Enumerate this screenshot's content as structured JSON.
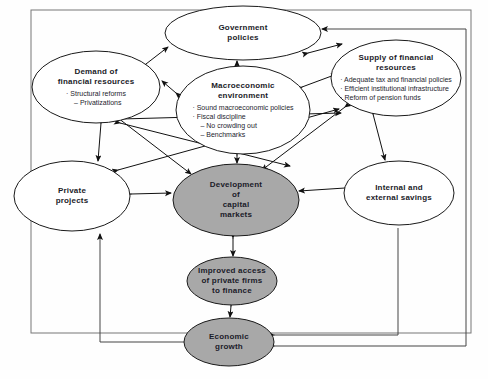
{
  "diagram": {
    "border_color": "#6a6a6a",
    "shaded_fill": "#a8a8a8",
    "plain_fill": "#ffffff",
    "stroke": "#1a1a1a",
    "nodes": [
      {
        "id": "government-policies",
        "title": "Government\npolicies",
        "title_lines": [
          "Government",
          "policies"
        ],
        "bullets": [],
        "shaded": false,
        "cx": 243,
        "cy": 33,
        "rx": 78,
        "ry": 27
      },
      {
        "id": "demand-of-financial-resources",
        "title_lines": [
          "Demand of",
          "financial resources"
        ],
        "bullets": [
          {
            "level": 1,
            "text": "· Structural reforms"
          },
          {
            "level": 2,
            "text": "– Privatizations"
          }
        ],
        "shaded": false,
        "cx": 96,
        "cy": 87,
        "rx": 64,
        "ry": 36
      },
      {
        "id": "macroeconomic-environment",
        "title_lines": [
          "Macroeconomic",
          "environment"
        ],
        "bullets": [
          {
            "level": 1,
            "text": "· Sound macroeconomic policies"
          },
          {
            "level": 1,
            "text": "· Fiscal discipline"
          },
          {
            "level": 2,
            "text": "– No crowding out"
          },
          {
            "level": 2,
            "text": "– Benchmarks"
          }
        ],
        "shaded": false,
        "cx": 243,
        "cy": 110,
        "rx": 67,
        "ry": 44
      },
      {
        "id": "supply-of-financial-resources",
        "title_lines": [
          "Supply of financial",
          "resources"
        ],
        "bullets": [
          {
            "level": 1,
            "text": "· Adequate tax and financial policies"
          },
          {
            "level": 1,
            "text": "· Efficient institutional infrastructure"
          },
          {
            "level": 1,
            "text": "· Reform of pension funds"
          }
        ],
        "shaded": false,
        "cx": 396,
        "cy": 78,
        "rx": 65,
        "ry": 38
      },
      {
        "id": "private-projects",
        "title_lines": [
          "Private",
          "projects"
        ],
        "bullets": [],
        "shaded": false,
        "cx": 72,
        "cy": 196,
        "rx": 58,
        "ry": 35
      },
      {
        "id": "development-of-capital-markets",
        "title_lines": [
          "Development",
          "of",
          "capital",
          "markets"
        ],
        "bullets": [],
        "shaded": true,
        "cx": 236,
        "cy": 200,
        "rx": 63,
        "ry": 36
      },
      {
        "id": "internal-and-external-savings",
        "title_lines": [
          "Internal and",
          "external savings"
        ],
        "bullets": [],
        "shaded": false,
        "cx": 399,
        "cy": 193,
        "rx": 55,
        "ry": 32
      },
      {
        "id": "improved-access-of-private-firms-to-finance",
        "title_lines": [
          "Improved access",
          "of private firms",
          "to finance"
        ],
        "bullets": [],
        "shaded": true,
        "cx": 232,
        "cy": 281,
        "rx": 45,
        "ry": 24
      },
      {
        "id": "economic-growth",
        "title_lines": [
          "Economic",
          "growth"
        ],
        "bullets": [],
        "shaded": true,
        "cx": 229,
        "cy": 342,
        "rx": 45,
        "ry": 24
      }
    ],
    "edges": [
      {
        "from": "demand-of-financial-resources",
        "to": "government-policies",
        "style": "bidirectional"
      },
      {
        "from": "macroeconomic-environment",
        "to": "government-policies",
        "style": "bidirectional"
      },
      {
        "from": "supply-of-financial-resources",
        "to": "government-policies",
        "style": "bidirectional"
      },
      {
        "from": "macroeconomic-environment",
        "to": "supply-of-financial-resources",
        "style": "bidirectional"
      },
      {
        "from": "macroeconomic-environment",
        "to": "demand-of-financial-resources",
        "style": "bidirectional"
      },
      {
        "from": "demand-of-financial-resources",
        "to": "private-projects",
        "style": "bidirectional"
      },
      {
        "from": "demand-of-financial-resources",
        "to": "development-of-capital-markets",
        "style": "bidirectional"
      },
      {
        "from": "supply-of-financial-resources",
        "to": "development-of-capital-markets",
        "style": "bidirectional"
      },
      {
        "from": "macroeconomic-environment",
        "to": "development-of-capital-markets",
        "style": "bidirectional"
      },
      {
        "from": "private-projects",
        "to": "development-of-capital-markets",
        "style": "bidirectional"
      },
      {
        "from": "internal-and-external-savings",
        "to": "development-of-capital-markets",
        "style": "bidirectional"
      },
      {
        "from": "supply-of-financial-resources",
        "to": "internal-and-external-savings",
        "style": "bidirectional"
      },
      {
        "from": "development-of-capital-markets",
        "to": "improved-access-of-private-firms-to-finance",
        "style": "bidirectional"
      },
      {
        "from": "improved-access-of-private-firms-to-finance",
        "to": "economic-growth",
        "style": "bidirectional"
      },
      {
        "from": "economic-growth",
        "to": "private-projects",
        "style": "feedback-left"
      },
      {
        "from": "economic-growth",
        "to": "internal-and-external-savings",
        "style": "feedback-right"
      },
      {
        "from": "economic-growth",
        "to": "government-policies",
        "style": "feedback-far-right"
      }
    ]
  }
}
